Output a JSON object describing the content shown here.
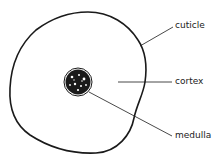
{
  "diagram": {
    "labels": {
      "cuticle": "cuticle",
      "cortex": "cortex",
      "medulla": "medulla"
    },
    "colors": {
      "stroke": "#1a1a1a",
      "background": "#ffffff"
    }
  }
}
